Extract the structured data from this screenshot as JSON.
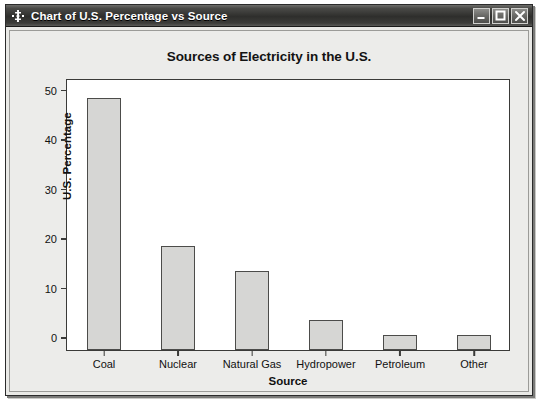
{
  "window": {
    "title": "Chart of U.S. Percentage vs Source",
    "icon": "move-crosshair-icon",
    "buttons": {
      "minimize": "Minimize",
      "maximize": "Maximize",
      "close": "Close"
    }
  },
  "chart_data": {
    "type": "bar",
    "title": "Sources of Electricity in the U.S.",
    "xlabel": "Source",
    "ylabel": "U.S. Percentage",
    "categories": [
      "Coal",
      "Nuclear",
      "Natural Gas",
      "Hydropower",
      "Petroleum",
      "Other"
    ],
    "values": [
      51,
      21,
      16,
      6,
      3,
      3
    ],
    "ylim": [
      0,
      55
    ],
    "yticks": [
      0,
      10,
      20,
      30,
      40,
      50
    ],
    "ytick_labels": [
      "0",
      "10",
      "20",
      "30",
      "40",
      "50"
    ],
    "grid": false,
    "legend": false,
    "bar_fill": "#d6d6d4",
    "bar_edge": "#4c4c4a",
    "plot_background": "#ffffff"
  }
}
